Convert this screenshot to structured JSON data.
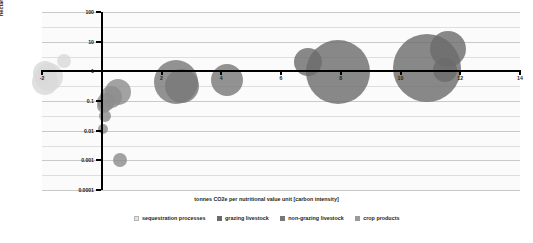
{
  "chart_data": {
    "type": "scatter",
    "title": "",
    "xlabel": "tonnes CO2e per nutritional value unit [carbon intensity]",
    "ylabel": "hectares per nutritional value unit [land intensity]",
    "xlim": [
      -2,
      14
    ],
    "ylim": [
      0.0001,
      100
    ],
    "yscale": "log",
    "xscale": "linear",
    "xticks": [
      "-2",
      "2",
      "4",
      "6",
      "8",
      "10",
      "12",
      "14"
    ],
    "xtick_values": [
      -2,
      2,
      4,
      6,
      8,
      10,
      12,
      14
    ],
    "yticks": [
      "100",
      "10",
      "1",
      "0.1",
      "0.01",
      "0.001",
      "0.0001"
    ],
    "ytick_values": [
      100,
      10,
      1,
      0.1,
      0.01,
      0.001,
      0.0001
    ],
    "grid": true,
    "grid_axis": "y",
    "legend_position": "bottom",
    "bubble_note": "bubble area encodes magnitude",
    "series": [
      {
        "name": "sequestration processes",
        "color": "#d9d9d9",
        "points": [
          {
            "x": -1.25,
            "y": 2.2,
            "size": 7
          },
          {
            "x": -1.9,
            "y": 0.85,
            "size": 12
          },
          {
            "x": -1.75,
            "y": 0.62,
            "size": 14
          },
          {
            "x": -1.9,
            "y": 0.45,
            "size": 13
          }
        ]
      },
      {
        "name": "grazing livestock",
        "color": "#6b6b6b",
        "points": [
          {
            "x": 6.9,
            "y": 2.1,
            "size": 14
          },
          {
            "x": 7.9,
            "y": 0.95,
            "size": 32
          },
          {
            "x": 10.9,
            "y": 1.3,
            "size": 34
          },
          {
            "x": 11.6,
            "y": 5.5,
            "size": 18
          },
          {
            "x": 11.5,
            "y": 1.1,
            "size": 12
          }
        ]
      },
      {
        "name": "non-grazing livestock",
        "color": "#787878",
        "points": [
          {
            "x": 2.5,
            "y": 0.45,
            "size": 22
          },
          {
            "x": 2.7,
            "y": 0.33,
            "size": 17
          },
          {
            "x": 4.2,
            "y": 0.52,
            "size": 16
          }
        ]
      },
      {
        "name": "crop products",
        "color": "#8c8c8c",
        "points": [
          {
            "x": 0.55,
            "y": 0.2,
            "size": 13
          },
          {
            "x": 0.3,
            "y": 0.14,
            "size": 11
          },
          {
            "x": 0.15,
            "y": 0.095,
            "size": 9
          },
          {
            "x": 0.08,
            "y": 0.07,
            "size": 7
          },
          {
            "x": 0.1,
            "y": 0.032,
            "size": 6
          },
          {
            "x": 0.05,
            "y": 0.011,
            "size": 5
          },
          {
            "x": 0.62,
            "y": 0.001,
            "size": 7
          }
        ]
      }
    ]
  },
  "legend": {
    "items": [
      {
        "label": "sequestration processes",
        "color": "#e3e3e3"
      },
      {
        "label": "grazing livestock",
        "color": "#6b6b6b"
      },
      {
        "label": "non-grazing livestock",
        "color": "#787878"
      },
      {
        "label": "crop products",
        "color": "#9a9a9a"
      }
    ]
  }
}
